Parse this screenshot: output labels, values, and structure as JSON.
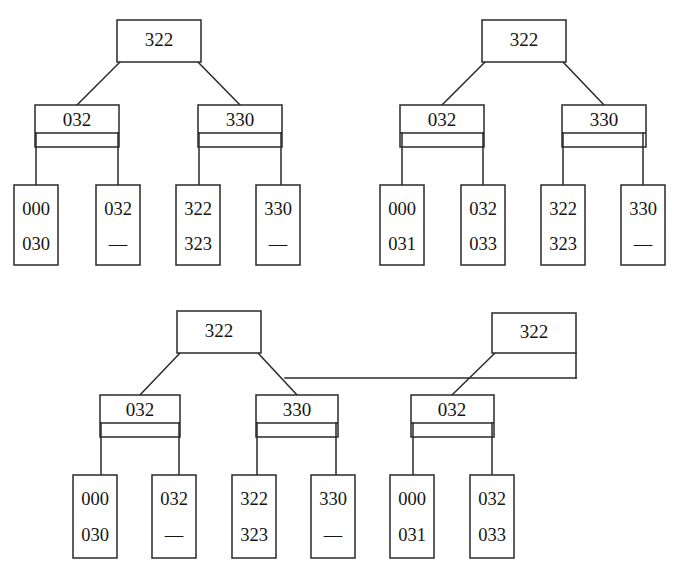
{
  "figure": {
    "line_color": "#2a2a2a",
    "background_color": "#ffffff",
    "dash_symbol": "—"
  },
  "trees": [
    {
      "id": "tree-top-left",
      "root": {
        "label": "322",
        "x": 117,
        "y": 20,
        "w": 84,
        "h": 42
      },
      "internals": [
        {
          "label": "032",
          "x": 35,
          "y": 105,
          "w": 84,
          "h": 42,
          "divider_y": 133,
          "children": [
            0,
            1
          ]
        },
        {
          "label": "330",
          "x": 198,
          "y": 105,
          "w": 84,
          "h": 42,
          "divider_y": 133,
          "children": [
            2,
            3
          ]
        }
      ],
      "leaves": [
        {
          "x": 14,
          "y": 185,
          "w": 44,
          "h": 80,
          "values": [
            "000",
            "030"
          ]
        },
        {
          "x": 96,
          "y": 185,
          "w": 44,
          "h": 80,
          "values": [
            "032",
            "—"
          ]
        },
        {
          "x": 176,
          "y": 185,
          "w": 44,
          "h": 80,
          "values": [
            "322",
            "323"
          ]
        },
        {
          "x": 256,
          "y": 185,
          "w": 44,
          "h": 80,
          "values": [
            "330",
            "—"
          ]
        }
      ]
    },
    {
      "id": "tree-top-right",
      "root": {
        "label": "322",
        "x": 482,
        "y": 20,
        "w": 84,
        "h": 42
      },
      "internals": [
        {
          "label": "032",
          "x": 400,
          "y": 105,
          "w": 84,
          "h": 42,
          "divider_y": 133,
          "children": [
            0,
            1
          ]
        },
        {
          "label": "330",
          "x": 562,
          "y": 105,
          "w": 84,
          "h": 42,
          "divider_y": 133,
          "children": [
            2,
            3
          ]
        }
      ],
      "leaves": [
        {
          "x": 380,
          "y": 185,
          "w": 44,
          "h": 80,
          "values": [
            "000",
            "031"
          ]
        },
        {
          "x": 461,
          "y": 185,
          "w": 44,
          "h": 80,
          "values": [
            "032",
            "033"
          ]
        },
        {
          "x": 541,
          "y": 185,
          "w": 44,
          "h": 80,
          "values": [
            "322",
            "323"
          ]
        },
        {
          "x": 621,
          "y": 185,
          "w": 44,
          "h": 80,
          "values": [
            "330",
            "—"
          ]
        }
      ]
    },
    {
      "id": "tree-bottom",
      "root": {
        "label": "322",
        "x": 177,
        "y": 311,
        "w": 84,
        "h": 42
      },
      "root_right": {
        "label": "322",
        "x": 492,
        "y": 313,
        "w": 84,
        "h": 40
      },
      "internals": [
        {
          "label": "032",
          "x": 100,
          "y": 395,
          "w": 80,
          "h": 42,
          "divider_y": 423,
          "children": [
            0,
            1
          ]
        },
        {
          "label": "330",
          "x": 256,
          "y": 395,
          "w": 82,
          "h": 42,
          "divider_y": 423,
          "children": [
            2,
            3
          ]
        },
        {
          "label": "032",
          "x": 411,
          "y": 395,
          "w": 83,
          "h": 42,
          "divider_y": 423,
          "children": [
            4,
            5
          ]
        }
      ],
      "leaves": [
        {
          "x": 73,
          "y": 475,
          "w": 44,
          "h": 83,
          "values": [
            "000",
            "030"
          ]
        },
        {
          "x": 152,
          "y": 475,
          "w": 44,
          "h": 83,
          "values": [
            "032",
            "—"
          ]
        },
        {
          "x": 232,
          "y": 475,
          "w": 44,
          "h": 83,
          "values": [
            "322",
            "323"
          ]
        },
        {
          "x": 311,
          "y": 475,
          "w": 44,
          "h": 83,
          "values": [
            "330",
            "—"
          ]
        },
        {
          "x": 390,
          "y": 475,
          "w": 44,
          "h": 83,
          "values": [
            "000",
            "031"
          ]
        },
        {
          "x": 470,
          "y": 475,
          "w": 44,
          "h": 83,
          "values": [
            "032",
            "033"
          ]
        }
      ]
    }
  ]
}
